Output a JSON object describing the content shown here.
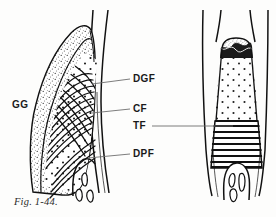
{
  "figure": {
    "caption": "Fig. 1-44.",
    "ink_color": "#111111",
    "background_color": "#fdfdfc"
  },
  "labels": {
    "gg": "GG",
    "dgf": "DGF",
    "cf": "CF",
    "tf": "TF",
    "dpf": "DPF"
  },
  "panels": {
    "left": {
      "name": "facial-section-view"
    },
    "right": {
      "name": "interproximal-section-view"
    }
  }
}
